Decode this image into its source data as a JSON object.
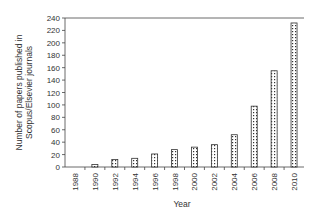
{
  "chart_data": {
    "type": "bar",
    "title": "",
    "xlabel": "Year",
    "ylabel": "Number of papers published in Scopus/Elsevier journals",
    "ylabel_lines": [
      "Number of papers published in",
      "Scopus/Elsevier journals"
    ],
    "categories": [
      "1988",
      "1990",
      "1992",
      "1994",
      "1996",
      "1998",
      "2000",
      "2002",
      "2004",
      "2006",
      "2008",
      "2010"
    ],
    "values": [
      0,
      4,
      12,
      14,
      21,
      28,
      32,
      36,
      52,
      98,
      155,
      232
    ],
    "ylim": [
      0,
      240
    ],
    "yticks": [
      0,
      20,
      40,
      60,
      80,
      100,
      120,
      140,
      160,
      180,
      200,
      220,
      240
    ],
    "grid": false,
    "legend": null,
    "bar_pattern": "dotted",
    "colors": {
      "bar_fill": "#ffffff",
      "bar_stroke": "#333333",
      "dots": "#333333",
      "axis": "#444444"
    }
  }
}
